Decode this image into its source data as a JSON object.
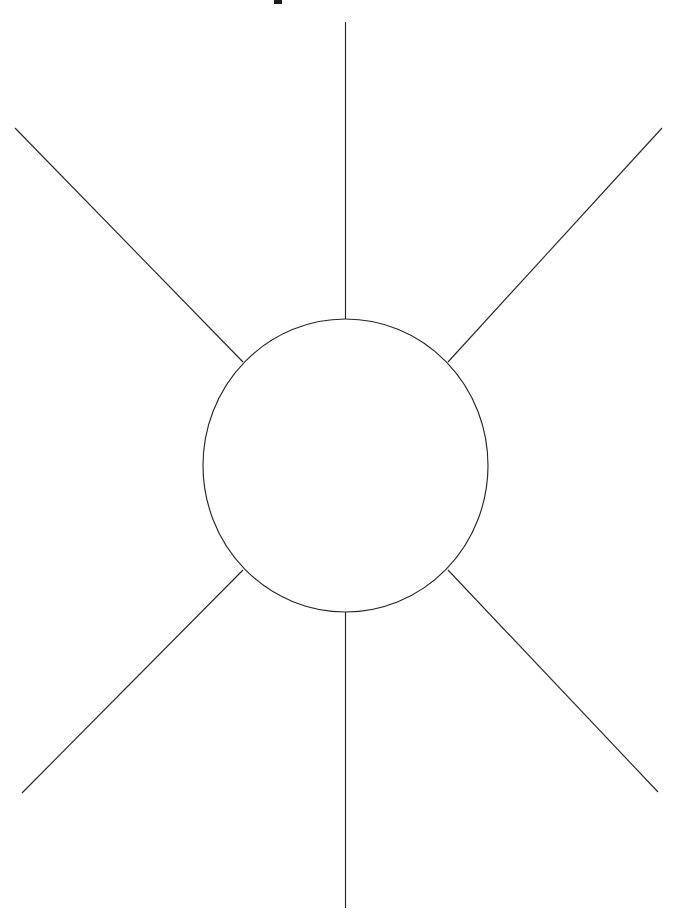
{
  "page": {
    "title": "Radiating Circle Line Diagram",
    "background_color": "#ffffff",
    "width": 678,
    "height": 915
  },
  "chart_data": {
    "type": "diagram",
    "title": "",
    "subtitle": "",
    "xlabel": "",
    "ylabel": "",
    "description": "A single thin-stroked circle centered in the frame with six straight rays radiating outward from its circumference: one straight up, one straight down, and four diagonals toward the upper-left, upper-right, lower-left and lower-right corners. Rendered as black line art on a plain white background.",
    "stroke_color": "#262626",
    "stroke_width": 1.15,
    "fill": "none",
    "background": "#ffffff",
    "circle": {
      "label": "central-circle",
      "center_x": 345.5,
      "center_y": 465.5,
      "radius_x": 142.5,
      "radius_y": 146.5,
      "top_y": 319,
      "bottom_y": 612,
      "left_x": 203,
      "right_x": 488
    },
    "rays": [
      {
        "name": "ray-up",
        "direction": "up",
        "angle_deg": 90,
        "x1": 345.5,
        "y1": 22,
        "x2": 345.5,
        "y2": 319
      },
      {
        "name": "ray-down",
        "direction": "down",
        "angle_deg": 270,
        "x1": 345.5,
        "y1": 612,
        "x2": 345.5,
        "y2": 908
      },
      {
        "name": "ray-upper-left",
        "direction": "upper-left",
        "angle_deg": 135,
        "x1": 15,
        "y1": 128,
        "x2": 243,
        "y2": 362
      },
      {
        "name": "ray-upper-right",
        "direction": "upper-right",
        "angle_deg": 45,
        "x1": 662,
        "y1": 128,
        "x2": 448,
        "y2": 362
      },
      {
        "name": "ray-lower-left",
        "direction": "lower-left",
        "angle_deg": 225,
        "x1": 22,
        "y1": 793,
        "x2": 243,
        "y2": 570
      },
      {
        "name": "ray-lower-right",
        "direction": "lower-right",
        "angle_deg": 315,
        "x1": 658,
        "y1": 792,
        "x2": 448,
        "y2": 570
      }
    ],
    "crop_artifact": {
      "name": "cropped-glyph-remnant",
      "note": "Small dark rectangular remnant of a character clipped by the top edge of the frame.",
      "x": 274,
      "y": 0,
      "width": 8,
      "height": 4,
      "color": "#1c1c1c"
    },
    "grid": false,
    "legend": false
  }
}
